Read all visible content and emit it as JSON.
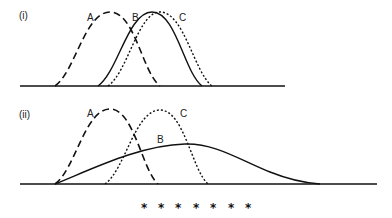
{
  "panels": [
    {
      "id": "i",
      "label": "(i)",
      "curves": [
        {
          "name": "A",
          "label": "A",
          "style": "long-dashed",
          "description": "normal distribution, left"
        },
        {
          "name": "B",
          "label": "B",
          "style": "solid",
          "description": "normal distribution, shifted right"
        },
        {
          "name": "C",
          "label": "C",
          "style": "dotted",
          "description": "normal distribution, slightly right of B"
        }
      ]
    },
    {
      "id": "ii",
      "label": "(ii)",
      "curves": [
        {
          "name": "A",
          "label": "A",
          "style": "long-dashed",
          "description": "narrow normal distribution, left"
        },
        {
          "name": "B",
          "label": "B",
          "style": "solid",
          "description": "wide, flat, right-skewed distribution"
        },
        {
          "name": "C",
          "label": "C",
          "style": "dotted",
          "description": "narrow normal distribution, right of A"
        }
      ]
    }
  ],
  "footer": {
    "separator": "* * * * * * *",
    "stars": [
      "*",
      "*",
      "*",
      "*",
      "*",
      "*",
      "*"
    ]
  },
  "colors": {
    "ink": "#111111",
    "background": "#ffffff"
  }
}
